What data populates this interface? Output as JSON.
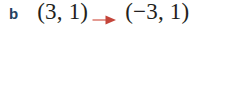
{
  "problem": {
    "part_label": "b",
    "expression_left": "(3, 1)",
    "arrow_icon": "right-arrow-icon",
    "expression_right": "(−3, 1)"
  },
  "colors": {
    "background": "#ffffff",
    "part_label": "#23415f",
    "expression_text": "#231f20",
    "arrow_line": "#e0897f",
    "arrow_head": "#c4453a"
  }
}
